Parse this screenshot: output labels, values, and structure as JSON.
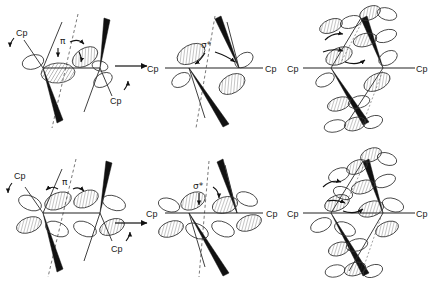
{
  "figure": {
    "type": "chemistry-orbital-diagram",
    "background_color": "#ffffff",
    "ink_color": "#1a1a1a",
    "layout": "2 rows x 3 columns of molecular orbital schematics",
    "panel_count": 6
  },
  "labels": {
    "cp": "Cp",
    "pi": "π",
    "sigma_star": "σ*"
  },
  "panels": [
    {
      "id": "top-left",
      "row": 1,
      "column": 1,
      "interaction_label": "π",
      "cp_labels": [
        "Cp",
        "Cp"
      ],
      "cp_positions": [
        "upper-left",
        "lower-right"
      ],
      "orbital_style": "two-lobe p-type, hatched",
      "has_curved_arrows": true,
      "has_dashed_axis": true,
      "has_bold_wedges": true
    },
    {
      "id": "top-middle",
      "row": 1,
      "column": 2,
      "interaction_label": "σ*",
      "cp_labels": [
        "Cp",
        "Cp"
      ],
      "cp_positions": [
        "left",
        "right"
      ],
      "orbital_style": "two-lobe p-type, hatched",
      "has_curved_arrows": true,
      "has_dashed_axis": true,
      "has_bold_wedges": true
    },
    {
      "id": "top-right",
      "row": 1,
      "column": 3,
      "interaction_label": "",
      "cp_labels": [
        "Cp",
        "Cp"
      ],
      "cp_positions": [
        "left",
        "right"
      ],
      "orbital_style": "multi-lobe delocalized set, hatched",
      "has_curved_arrows": true,
      "has_dashed_axis": true,
      "has_bold_wedges": true
    },
    {
      "id": "bottom-left",
      "row": 2,
      "column": 1,
      "interaction_label": "π",
      "cp_labels": [
        "Cp",
        "Cp"
      ],
      "cp_positions": [
        "upper-left",
        "lower-right"
      ],
      "orbital_style": "four-lobe d-type, hatched",
      "has_curved_arrows": true,
      "has_dashed_axis": true,
      "has_bold_wedges": true
    },
    {
      "id": "bottom-middle",
      "row": 2,
      "column": 2,
      "interaction_label": "σ*",
      "cp_labels": [
        "Cp",
        "Cp"
      ],
      "cp_positions": [
        "left",
        "right"
      ],
      "orbital_style": "four-lobe d-type, hatched",
      "has_curved_arrows": true,
      "has_dashed_axis": true,
      "has_bold_wedges": true
    },
    {
      "id": "bottom-right",
      "row": 2,
      "column": 3,
      "interaction_label": "",
      "cp_labels": [
        "Cp",
        "Cp"
      ],
      "cp_positions": [
        "left",
        "right"
      ],
      "orbital_style": "multi-lobe delocalized set, hatched",
      "has_curved_arrows": true,
      "has_dashed_axis": true,
      "has_bold_wedges": true
    }
  ],
  "reaction_arrows": [
    {
      "id": "top-arrow",
      "row": 1,
      "direction": "right"
    },
    {
      "id": "bottom-arrow",
      "row": 2,
      "direction": "right"
    }
  ]
}
